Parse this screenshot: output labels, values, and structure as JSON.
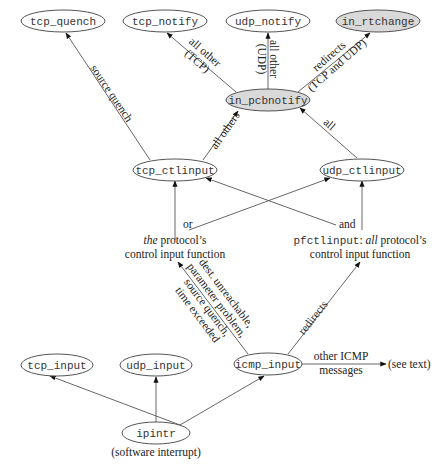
{
  "colors": {
    "node_fill_plain": "#ffffff",
    "node_fill_highlight": "#d9d9d9",
    "stroke": "#555555",
    "text": "#333333"
  },
  "nodes": {
    "tcp_quench": "tcp_quench",
    "tcp_notify": "tcp_notify",
    "udp_notify": "udp_notify",
    "in_rtchange": "in_rtchange",
    "in_pcbnotify": "in_pcbnotify",
    "tcp_ctlinput": "tcp_ctlinput",
    "udp_ctlinput": "udp_ctlinput",
    "tcp_input": "tcp_input",
    "udp_input": "udp_input",
    "icmp_input": "icmp_input",
    "ipintr": "ipintr"
  },
  "captions": {
    "ipintr_sub": "(software interrupt)",
    "see_text": "(see text)",
    "or": "or",
    "the": "the",
    "protocols": " protocol’s",
    "control_input_function_left": "control input function",
    "and": "and",
    "pfctlinput": "pfctlinput",
    "colon_all": ": ",
    "all_italic": "all",
    "protocols_right": " protocol’s",
    "control_input_function_right": "control input function"
  },
  "edge_labels": {
    "source_quench": "source quench",
    "all_other_tcp_1": "all other",
    "all_other_tcp_2": "(TCP)",
    "all_other_udp_1": "all other",
    "all_other_udp_2": "(UDP)",
    "redirects_top_1": "redirects",
    "redirects_top_2": "(TCP and UDP)",
    "all_others": "all others",
    "all": "all",
    "icmp_err_1": "dest. unreachable,",
    "icmp_err_2": "parameter problem,",
    "icmp_err_3": "source quench,",
    "icmp_err_4": "time exceeded",
    "redirects_bottom": "redirects",
    "other_icmp_1": "other ICMP",
    "other_icmp_2": "messages"
  }
}
